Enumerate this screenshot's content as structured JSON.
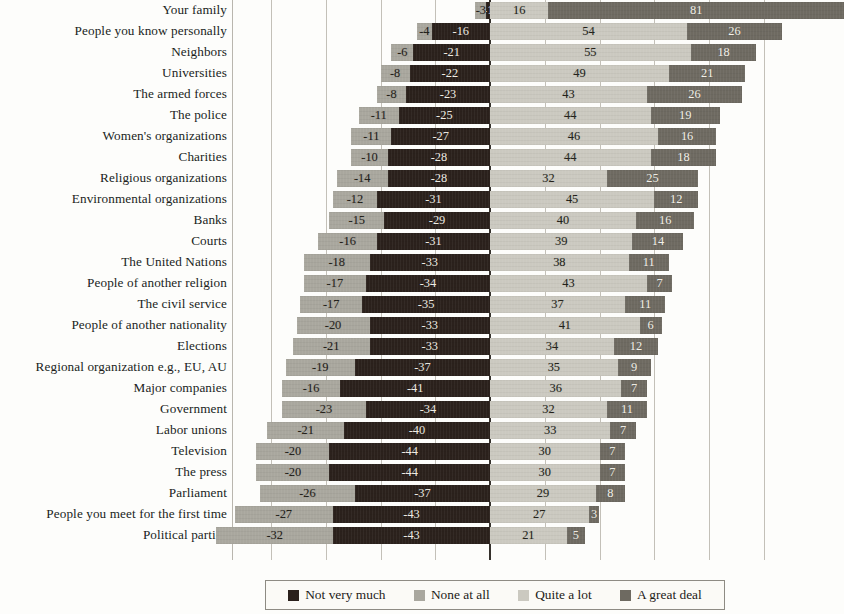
{
  "chart_data": {
    "type": "bar",
    "subtype": "diverging-stacked-likert",
    "title": "",
    "subtitle": "",
    "xlabel": "",
    "ylabel": "",
    "xlim": [
      -60,
      100
    ],
    "grid": true,
    "gridlines_x": [
      -60,
      -45,
      -30,
      -15,
      0,
      15,
      30,
      45,
      60,
      75
    ],
    "legend_position": "bottom",
    "orientation": "horizontal",
    "value_unit": "percent",
    "negative_values_shown_with_minus": true,
    "series": [
      {
        "name": "Not very much",
        "color": "#2b211c",
        "side": "negative",
        "stack_order": 2,
        "values": [
          -1,
          -16,
          -21,
          -22,
          -23,
          -25,
          -27,
          -28,
          -28,
          -31,
          -29,
          -31,
          -33,
          -34,
          -35,
          -33,
          -33,
          -37,
          -41,
          -34,
          -40,
          -44,
          -44,
          -37,
          -43,
          -43
        ]
      },
      {
        "name": "None at all",
        "color": "#a9a79e",
        "side": "negative",
        "stack_order": 1,
        "values": [
          null,
          -4,
          -6,
          -8,
          -8,
          -11,
          -11,
          -10,
          -14,
          -12,
          -15,
          -16,
          -18,
          -17,
          -17,
          -20,
          -21,
          -19,
          -16,
          -23,
          -21,
          -20,
          -20,
          -26,
          -27,
          -32
        ]
      },
      {
        "name": "Quite a lot",
        "color": "#cbc9c0",
        "side": "positive",
        "stack_order": 3,
        "values": [
          16,
          54,
          55,
          49,
          43,
          44,
          46,
          44,
          32,
          45,
          40,
          39,
          38,
          43,
          37,
          41,
          34,
          35,
          36,
          32,
          33,
          30,
          30,
          29,
          27,
          21
        ]
      },
      {
        "name": "A great deal",
        "color": "#6e6a61",
        "side": "positive",
        "stack_order": 4,
        "values": [
          81,
          26,
          18,
          21,
          26,
          19,
          16,
          18,
          25,
          12,
          16,
          14,
          11,
          7,
          11,
          6,
          12,
          9,
          7,
          11,
          7,
          7,
          7,
          8,
          3,
          5
        ]
      }
    ],
    "categories": [
      "Your family",
      "People you know personally",
      "Neighbors",
      "Universities",
      "The armed forces",
      "The police",
      "Women's organizations",
      "Charities",
      "Religious organizations",
      "Environmental organizations",
      "Banks",
      "Courts",
      "The United Nations",
      "People of another religion",
      "The civil service",
      "People of another nationality",
      "Elections",
      "Regional organization e.g., EU, AU",
      "Major companies",
      "Government",
      "Labor unions",
      "Television",
      "The press",
      "Parliament",
      "People you meet for the first time",
      "Political parties"
    ],
    "rows": [
      {
        "label": "Your family",
        "none_at_all": -3,
        "not_very_much": -1,
        "quite_a_lot": 16,
        "a_great_deal": 81
      },
      {
        "label": "People you know personally",
        "none_at_all": -4,
        "not_very_much": -16,
        "quite_a_lot": 54,
        "a_great_deal": 26
      },
      {
        "label": "Neighbors",
        "none_at_all": -6,
        "not_very_much": -21,
        "quite_a_lot": 55,
        "a_great_deal": 18
      },
      {
        "label": "Universities",
        "none_at_all": -8,
        "not_very_much": -22,
        "quite_a_lot": 49,
        "a_great_deal": 21
      },
      {
        "label": "The armed forces",
        "none_at_all": -8,
        "not_very_much": -23,
        "quite_a_lot": 43,
        "a_great_deal": 26
      },
      {
        "label": "The police",
        "none_at_all": -11,
        "not_very_much": -25,
        "quite_a_lot": 44,
        "a_great_deal": 19
      },
      {
        "label": "Women's organizations",
        "none_at_all": -11,
        "not_very_much": -27,
        "quite_a_lot": 46,
        "a_great_deal": 16
      },
      {
        "label": "Charities",
        "none_at_all": -10,
        "not_very_much": -28,
        "quite_a_lot": 44,
        "a_great_deal": 18
      },
      {
        "label": "Religious organizations",
        "none_at_all": -14,
        "not_very_much": -28,
        "quite_a_lot": 32,
        "a_great_deal": 25
      },
      {
        "label": "Environmental organizations",
        "none_at_all": -12,
        "not_very_much": -31,
        "quite_a_lot": 45,
        "a_great_deal": 12
      },
      {
        "label": "Banks",
        "none_at_all": -15,
        "not_very_much": -29,
        "quite_a_lot": 40,
        "a_great_deal": 16
      },
      {
        "label": "Courts",
        "none_at_all": -16,
        "not_very_much": -31,
        "quite_a_lot": 39,
        "a_great_deal": 14
      },
      {
        "label": "The United Nations",
        "none_at_all": -18,
        "not_very_much": -33,
        "quite_a_lot": 38,
        "a_great_deal": 11
      },
      {
        "label": "People of another religion",
        "none_at_all": -17,
        "not_very_much": -34,
        "quite_a_lot": 43,
        "a_great_deal": 7
      },
      {
        "label": "The civil service",
        "none_at_all": -17,
        "not_very_much": -35,
        "quite_a_lot": 37,
        "a_great_deal": 11
      },
      {
        "label": "People of another nationality",
        "none_at_all": -20,
        "not_very_much": -33,
        "quite_a_lot": 41,
        "a_great_deal": 6
      },
      {
        "label": "Elections",
        "none_at_all": -21,
        "not_very_much": -33,
        "quite_a_lot": 34,
        "a_great_deal": 12
      },
      {
        "label": "Regional organization e.g., EU, AU",
        "none_at_all": -19,
        "not_very_much": -37,
        "quite_a_lot": 35,
        "a_great_deal": 9
      },
      {
        "label": "Major companies",
        "none_at_all": -16,
        "not_very_much": -41,
        "quite_a_lot": 36,
        "a_great_deal": 7
      },
      {
        "label": "Government",
        "none_at_all": -23,
        "not_very_much": -34,
        "quite_a_lot": 32,
        "a_great_deal": 11
      },
      {
        "label": "Labor unions",
        "none_at_all": -21,
        "not_very_much": -40,
        "quite_a_lot": 33,
        "a_great_deal": 7
      },
      {
        "label": "Television",
        "none_at_all": -20,
        "not_very_much": -44,
        "quite_a_lot": 30,
        "a_great_deal": 7
      },
      {
        "label": "The press",
        "none_at_all": -20,
        "not_very_much": -44,
        "quite_a_lot": 30,
        "a_great_deal": 7
      },
      {
        "label": "Parliament",
        "none_at_all": -26,
        "not_very_much": -37,
        "quite_a_lot": 29,
        "a_great_deal": 8
      },
      {
        "label": "People you meet for the first time",
        "none_at_all": -27,
        "not_very_much": -43,
        "quite_a_lot": 27,
        "a_great_deal": 3
      },
      {
        "label": "Political parties",
        "none_at_all": -32,
        "not_very_much": -43,
        "quite_a_lot": 21,
        "a_great_deal": 5
      }
    ]
  },
  "legend": {
    "items": [
      {
        "label": "Not very much",
        "color": "#2b211c"
      },
      {
        "label": "None at all",
        "color": "#a9a79e"
      },
      {
        "label": "Quite a lot",
        "color": "#cbc9c0"
      },
      {
        "label": "A great deal",
        "color": "#6e6a61"
      }
    ]
  }
}
